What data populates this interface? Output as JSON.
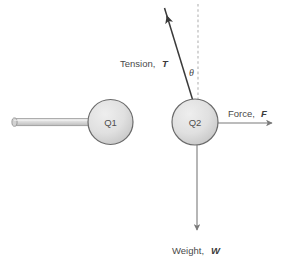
{
  "diagram": {
    "colors": {
      "sphere_fill_light": "#e8e8e8",
      "sphere_fill_dark": "#c9c9c9",
      "sphere_stroke": "#6b6b6b",
      "rod_fill": "#d9d9d9",
      "rod_stroke": "#8a8a8a",
      "arrow_stroke": "#7a7a7a",
      "tension_stroke": "#3a3a3a",
      "dashed_stroke": "#b0b0b0",
      "text_color": "#4a4a4a"
    },
    "spheres": [
      {
        "id": "q1",
        "label": "Q1",
        "cx": 110.5,
        "cy": 122,
        "r": 22.5
      },
      {
        "id": "q2",
        "label": "Q2",
        "cx": 195,
        "cy": 122,
        "r": 23
      }
    ],
    "rod": {
      "name": "support-rod",
      "x_start": 12,
      "x_end": 90,
      "y": 122,
      "thickness": 7,
      "cap_label": ""
    },
    "vectors": [
      {
        "id": "tension",
        "label_prefix": "Tension,",
        "symbol": "T",
        "label_x": 120,
        "label_y": 67,
        "x1": 193,
        "y1": 101,
        "x2": 164.5,
        "y2": 8
      },
      {
        "id": "force",
        "label_prefix": "Force,",
        "symbol": "F",
        "label_x": 228,
        "label_y": 117,
        "x1": 218,
        "y1": 123,
        "x2": 275,
        "y2": 123
      },
      {
        "id": "weight",
        "label_prefix": "Weight,",
        "symbol": "W",
        "label_x": 172,
        "label_y": 254,
        "x1": 197,
        "y1": 145,
        "x2": 197,
        "y2": 233
      }
    ],
    "reference_line": {
      "name": "vertical-dashed-reference",
      "x": 198,
      "y_top": 4,
      "y_bottom": 101
    },
    "angle": {
      "name": "theta-angle",
      "symbol": "θ",
      "x": 189,
      "y": 76,
      "value_text": ""
    }
  }
}
